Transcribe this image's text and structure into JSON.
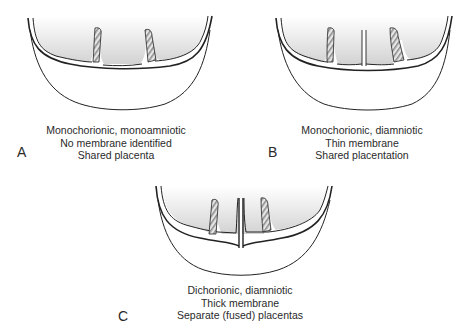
{
  "figure": {
    "panels": [
      {
        "letter": "A",
        "lines": [
          "Monochorionic, monoamniotic",
          "No membrane identified",
          "Shared placenta"
        ],
        "membrane": "none"
      },
      {
        "letter": "B",
        "lines": [
          "Monochorionic, diamniotic",
          "Thin membrane",
          "Shared placentation"
        ],
        "membrane": "thin"
      },
      {
        "letter": "C",
        "lines": [
          "Dichorionic, diamniotic",
          "Thick membrane",
          "Separate (fused) placentas"
        ],
        "membrane": "thick"
      }
    ],
    "colors": {
      "line": "#222222",
      "shade_dark": "#cfcfcf",
      "shade_light": "#ffffff",
      "cord_fill": "#9a9a9a"
    }
  }
}
